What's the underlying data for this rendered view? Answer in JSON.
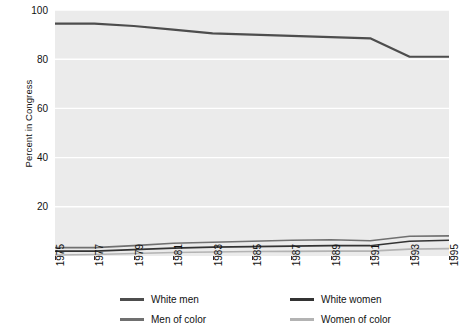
{
  "chart_data": {
    "type": "line",
    "title": "",
    "xlabel": "",
    "ylabel": "Percent in Congress",
    "xlim": [
      1975,
      1995
    ],
    "ylim": [
      0,
      100
    ],
    "grid": true,
    "legend_position": "bottom",
    "x": [
      1975,
      1977,
      1979,
      1981,
      1983,
      1985,
      1987,
      1989,
      1991,
      1993,
      1995
    ],
    "xtick_labels": [
      "1975",
      "1977",
      "1979",
      "1981",
      "1983",
      "1985",
      "1987",
      "1989",
      "1991",
      "1993",
      "1995"
    ],
    "ytick_labels": [
      "0",
      "20",
      "40",
      "60",
      "80",
      "100"
    ],
    "yticks": [
      0,
      20,
      40,
      60,
      80,
      100
    ],
    "series": [
      {
        "name": "White men",
        "color": "#4d4d4d",
        "width": 2.2,
        "values": [
          94.5,
          94.5,
          93.5,
          92.0,
          90.5,
          90.0,
          89.5,
          89.0,
          88.5,
          81.0,
          81.0
        ]
      },
      {
        "name": "White women",
        "color": "#333333",
        "width": 1.6,
        "values": [
          2.0,
          2.0,
          2.6,
          3.2,
          3.6,
          3.8,
          4.0,
          4.2,
          4.2,
          6.0,
          6.4
        ]
      },
      {
        "name": "Men of color",
        "color": "#707070",
        "width": 1.6,
        "values": [
          3.4,
          3.4,
          4.2,
          5.2,
          5.6,
          6.0,
          6.4,
          6.6,
          6.2,
          8.0,
          8.2
        ]
      },
      {
        "name": "Women of color",
        "color": "#b3b3b3",
        "width": 1.6,
        "values": [
          0.4,
          0.6,
          1.0,
          1.4,
          1.6,
          1.8,
          1.9,
          2.0,
          2.0,
          2.8,
          3.0
        ]
      }
    ]
  },
  "axes": {
    "ylabel": "Percent in Congress"
  },
  "legend": {
    "items": [
      {
        "label": "White men",
        "color": "#4d4d4d"
      },
      {
        "label": "White women",
        "color": "#333333"
      },
      {
        "label": "Men of color",
        "color": "#707070"
      },
      {
        "label": "Women of color",
        "color": "#b3b3b3"
      }
    ]
  },
  "panel": {
    "background": "#ebebeb",
    "gridline_color": "#ffffff"
  }
}
